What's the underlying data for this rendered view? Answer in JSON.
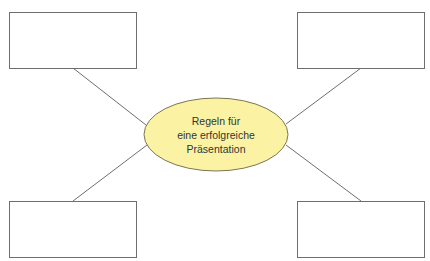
{
  "diagram": {
    "type": "mind-map",
    "center": {
      "lines": [
        "Regeln für",
        "eine erfolgreiche",
        "Präsentation"
      ],
      "fill": "#fbf3a3",
      "stroke": "#7a7650"
    },
    "branches": [
      {
        "position": "top-left",
        "text": ""
      },
      {
        "position": "top-right",
        "text": ""
      },
      {
        "position": "bottom-left",
        "text": ""
      },
      {
        "position": "bottom-right",
        "text": ""
      }
    ],
    "line_color": "#6e6e6e"
  }
}
